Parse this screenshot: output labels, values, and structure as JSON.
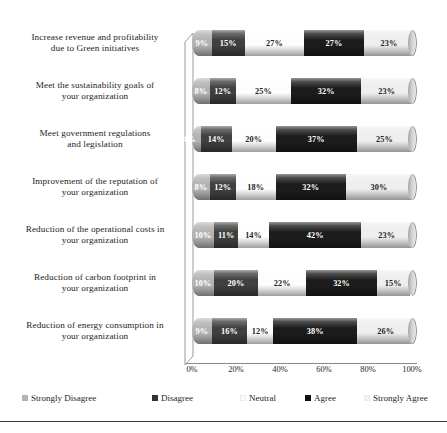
{
  "chart_data": {
    "type": "bar",
    "orientation": "horizontal",
    "stacked": true,
    "percent": true,
    "title": "",
    "xlabel": "",
    "ylabel": "",
    "xlim": [
      0,
      100
    ],
    "grid": false,
    "legend_position": "bottom",
    "xticks": [
      "0%",
      "20%",
      "40%",
      "60%",
      "80%",
      "100%"
    ],
    "xtick_values": [
      0,
      20,
      40,
      60,
      80,
      100
    ],
    "categories": [
      "Increase revenue and profitability due to Green initiatives",
      "Meet the sustainability goals of your organization",
      "Meet government regulations and legislation",
      "Improvement of the reputation of your organization",
      "Reduction of the operational costs in your organization",
      "Reduction of carbon footprint in your organization",
      "Reduction of energy consumption in your organization"
    ],
    "category_lines": [
      [
        "Increase revenue and profitability",
        "due to Green initiatives"
      ],
      [
        "Meet the sustainability goals of",
        "your organization"
      ],
      [
        "Meet government regulations",
        "and legislation"
      ],
      [
        "Improvement of the reputation of",
        "your organization"
      ],
      [
        "Reduction of the operational costs in",
        "your organization"
      ],
      [
        "Reduction of carbon footprint in",
        "your organization"
      ],
      [
        "Reduction of energy consumption in",
        "your organization"
      ]
    ],
    "series": [
      {
        "name": "Strongly Disagree",
        "color": "#b3b3b3",
        "text_color": "#ffffff",
        "values": [
          9,
          8,
          4,
          8,
          10,
          10,
          9
        ],
        "labels": [
          "9%",
          "8%",
          "4%",
          "8%",
          "10%",
          "10%",
          "9%"
        ]
      },
      {
        "name": "Disagree",
        "color": "#404040",
        "text_color": "#ffffff",
        "values": [
          15,
          12,
          14,
          12,
          11,
          20,
          16
        ],
        "labels": [
          "15%",
          "12%",
          "14%",
          "12%",
          "11%",
          "20%",
          "16%"
        ]
      },
      {
        "name": "Neutral",
        "color": "#fdfdfd",
        "text_color": "#231f20",
        "values": [
          27,
          25,
          20,
          18,
          14,
          22,
          12
        ],
        "labels": [
          "27%",
          "25%",
          "20%",
          "18%",
          "14%",
          "22%",
          "12%"
        ]
      },
      {
        "name": "Agree",
        "color": "#1c1c1c",
        "text_color": "#ffffff",
        "values": [
          27,
          32,
          37,
          32,
          42,
          32,
          38
        ],
        "labels": [
          "27%",
          "32%",
          "37%",
          "32%",
          "42%",
          "32%",
          "38%"
        ]
      },
      {
        "name": "Strongly Agree",
        "color": "#eeeeee",
        "text_color": "#231f20",
        "values": [
          23,
          23,
          25,
          30,
          23,
          15,
          26
        ],
        "labels": [
          "23%",
          "23%",
          "25%",
          "30%",
          "23%",
          "15%",
          "26%"
        ]
      }
    ]
  },
  "legend": {
    "items": [
      {
        "label": "Strongly Disagree",
        "color": "#b3b3b3"
      },
      {
        "label": "Disagree",
        "color": "#333333"
      },
      {
        "label": "Neutral",
        "color": "#fbfbfb"
      },
      {
        "label": "Agree",
        "color": "#101010"
      },
      {
        "label": "Strongly Agree",
        "color": "#f2f2f2"
      }
    ]
  }
}
